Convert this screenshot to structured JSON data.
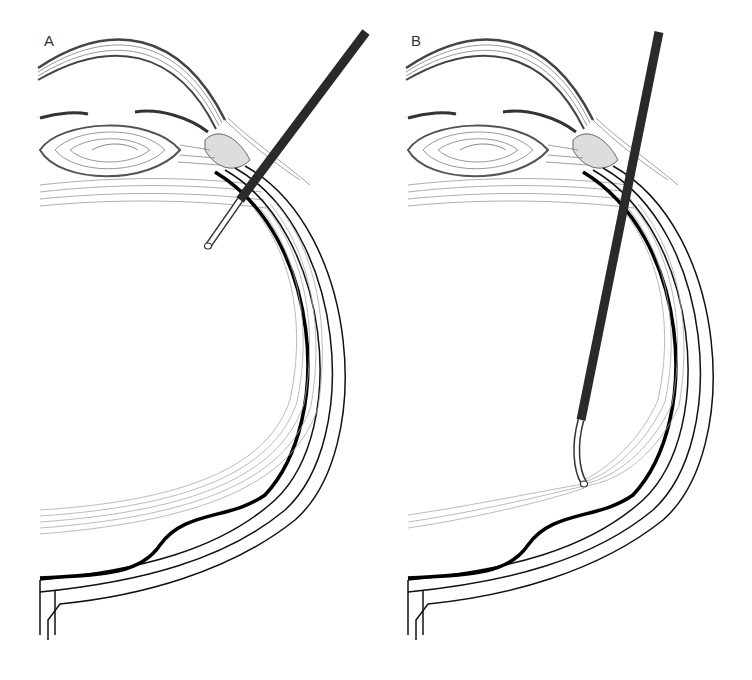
{
  "figure": {
    "panels": [
      {
        "label": "A",
        "instrument_position": "anterior, tip near ciliary body / anterior vitreous"
      },
      {
        "label": "B",
        "instrument_position": "posterior, tip touching posterior vitreous near retina"
      }
    ]
  },
  "colors": {
    "background": "#ffffff",
    "ink": "#1a1a1a",
    "instrument": "#2a2a2a",
    "fine_lines": "#888888"
  }
}
